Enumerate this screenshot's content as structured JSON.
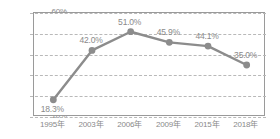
{
  "chart_data": {
    "type": "line",
    "title": "",
    "subtitle": "",
    "xlabel": "",
    "ylabel": "",
    "categories": [
      "1995年",
      "2003年",
      "2006年",
      "2009年",
      "2015年",
      "2018年"
    ],
    "values": [
      18.3,
      42.0,
      51.0,
      45.9,
      44.1,
      35.0
    ],
    "point_labels": [
      "18.3%",
      "42.0%",
      "51.0%",
      "45.9%",
      "44.1%",
      "35.0%"
    ],
    "series": [
      {
        "name": "",
        "values": [
          18.3,
          42.0,
          51.0,
          45.9,
          44.1,
          35.0
        ]
      }
    ],
    "ylim": [
      10,
      60
    ],
    "ytick_values": [
      10,
      20,
      30,
      40,
      50,
      60
    ],
    "ytick_labels": [
      "10%",
      "20%",
      "30%",
      "40%",
      "50%",
      "60%"
    ],
    "grid": true,
    "grid_style": "dashed-horizontal",
    "legend": false,
    "legend_position": "none",
    "line_color": "#8c8c8c",
    "marker_color": "#8c8c8c",
    "marker_shape": "circle",
    "axis_color": "#9a9a9a",
    "grid_color": "#b9b9b9",
    "text_color": "#8a8a8a",
    "background_color": "#ffffff"
  }
}
